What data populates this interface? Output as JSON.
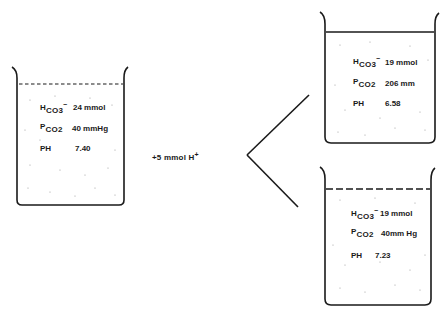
{
  "diagram": {
    "initial_beaker": {
      "hco3_label": "H",
      "hco3_sub": "CO3",
      "hco3_sup": "−",
      "hco3_value": "24 mmol",
      "pco2_label": "P",
      "pco2_sub": "CO2",
      "pco2_value": "40 mmHg",
      "ph_label": "PH",
      "ph_value": "7.40"
    },
    "addition": {
      "label": "+5  mmol  H",
      "sup": "+"
    },
    "closed_system_beaker": {
      "hco3_label": "H",
      "hco3_sub": "CO3",
      "hco3_sup": "−",
      "hco3_value": "19 mmol",
      "pco2_label": "P",
      "pco2_sub": "CO2",
      "pco2_value": "206 mm",
      "ph_label": "PH",
      "ph_value": "6.58"
    },
    "open_system_beaker": {
      "hco3_label": "H",
      "hco3_sub": "CO3",
      "hco3_sup": "−",
      "hco3_value": "19 mmol",
      "pco2_label": "P",
      "pco2_sub": "CO2",
      "pco2_value": "40mm Hg",
      "ph_label": "PH",
      "ph_value": "7.23"
    }
  }
}
